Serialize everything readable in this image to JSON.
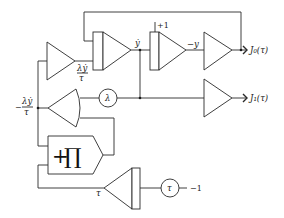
{
  "diagram": {
    "labels": {
      "ydot": "ẏ",
      "lambda_ydot_over_tau_num": "λẏ",
      "lambda_ydot_over_tau_den": "τ",
      "neg_lambda_ydot_over_tau_sign": "−",
      "neg_lambda_ydot_over_tau_num": "λẏ",
      "neg_lambda_ydot_over_tau_den": "τ",
      "plus_one": "+1",
      "neg_y": "−y",
      "out_j0": "J₀(τ)",
      "out_j1": "J₁(τ)",
      "lambda_coef": "λ",
      "tau_coef": "τ",
      "neg_one": "−1",
      "tau_out": "τ",
      "multiplier_plus": "+",
      "multiplier_pi": "∏"
    },
    "components": [
      {
        "id": "inverter-1",
        "type": "summer/inverter"
      },
      {
        "id": "integrator-1",
        "type": "integrator",
        "output": "ẏ"
      },
      {
        "id": "integrator-2",
        "type": "integrator",
        "initial": "+1",
        "output": "−y"
      },
      {
        "id": "inverter-j0",
        "type": "inverter",
        "output": "J₀(τ)"
      },
      {
        "id": "coefficient-lambda",
        "type": "coefficient",
        "value": "λ"
      },
      {
        "id": "divider",
        "type": "divider",
        "output": "−λẏ/τ"
      },
      {
        "id": "multiplier",
        "type": "multiplier",
        "symbol": "+∏"
      },
      {
        "id": "inverter-j1",
        "type": "inverter",
        "output": "J₁(τ)"
      },
      {
        "id": "integrator-tau",
        "type": "integrator",
        "output": "τ"
      },
      {
        "id": "coefficient-tau",
        "type": "coefficient",
        "value": "τ",
        "input": "−1"
      }
    ]
  }
}
